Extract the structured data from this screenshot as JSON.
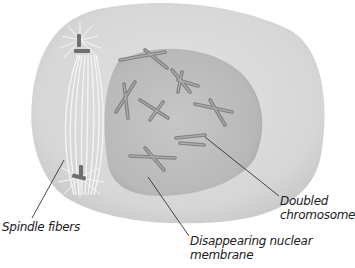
{
  "diagram": {
    "colors": {
      "cytoplasm": "#dcdcdc",
      "cytoplasm_edge": "#c9c9c9",
      "nucleus": "#bdbdbd",
      "chromosome": "#9a9a9a",
      "chromosome_edge": "#7d7d7d",
      "centriole": "#6e6e6e",
      "spindle": "#f4f4f4",
      "leader_line": "#333333"
    },
    "labels": {
      "spindle_fibers": "Spindle fibers",
      "doubled_chromosome": "Doubled\nchromosome",
      "nuclear_membrane": "Disappearing nuclear\nmembrane"
    }
  }
}
